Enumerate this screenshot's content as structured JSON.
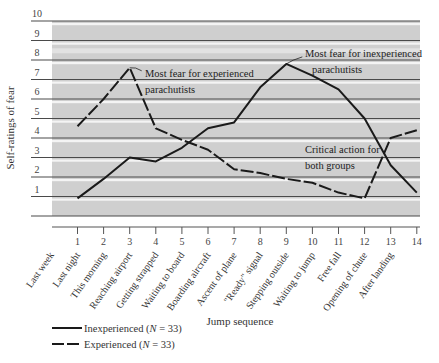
{
  "chart_data": {
    "type": "line",
    "title": "",
    "xlabel": "Jump sequence",
    "ylabel": "Self-ratings of fear",
    "ylim": [
      0,
      10
    ],
    "yticks": [
      1,
      2,
      3,
      4,
      5,
      6,
      7,
      8,
      9,
      10
    ],
    "x": [
      1,
      2,
      3,
      4,
      5,
      6,
      7,
      8,
      9,
      10,
      11,
      12,
      13,
      14
    ],
    "categories": [
      "Last week",
      "Last night",
      "This morning",
      "Reaching airport",
      "Getting strapped",
      "Waiting to board",
      "Boarding aircraft",
      "Ascent of plane",
      "\"Ready\" signal",
      "Stepping outside",
      "Waiting to jump",
      "Free fall",
      "Opening of chute",
      "After landing"
    ],
    "grid": true,
    "legend_position": "bottom-left",
    "series": [
      {
        "name": "Inexperienced (N = 33)",
        "style": "solid",
        "values": [
          0.9,
          1.9,
          3.0,
          2.8,
          3.5,
          4.5,
          4.8,
          6.6,
          7.8,
          7.2,
          6.5,
          5.0,
          2.6,
          1.2
        ]
      },
      {
        "name": "Experienced (N = 33)",
        "style": "dashed",
        "values": [
          4.6,
          6.0,
          7.6,
          4.5,
          3.9,
          3.4,
          2.4,
          2.2,
          1.9,
          1.7,
          1.2,
          0.9,
          4.0,
          4.4
        ]
      }
    ],
    "annotations": [
      {
        "text_lines": [
          "Most fear for experienced",
          "parachutists"
        ],
        "points_to": {
          "series": "Experienced",
          "x": 3
        }
      },
      {
        "text_lines": [
          "Most fear for inexperienced",
          "parachutists"
        ],
        "points_to": {
          "series": "Inexperienced",
          "x": 9
        }
      },
      {
        "text_lines": [
          "Critical action for",
          "both groups"
        ],
        "points_to": {
          "x": 12.7
        }
      }
    ]
  },
  "legend": [
    {
      "label": "Inexperienced (N = 33)",
      "prefix": "Inexperienced (",
      "n_symbol": "N",
      "suffix": " = 33)"
    },
    {
      "label": "Experienced (N = 33)",
      "prefix": "Experienced (",
      "n_symbol": "N",
      "suffix": " = 33)"
    }
  ]
}
